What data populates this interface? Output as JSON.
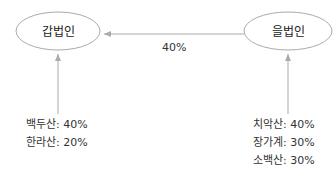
{
  "diagram": {
    "colors": {
      "stroke": "#aaaaaa",
      "text": "#333333",
      "background": "#ffffff"
    },
    "nodes": [
      {
        "id": "gap",
        "label": "갑법인"
      },
      {
        "id": "eul",
        "label": "을법인"
      }
    ],
    "edges": [
      {
        "from": "eul",
        "to": "gap",
        "label": "40%"
      }
    ],
    "shareholders": {
      "gap": [
        {
          "name": "백두산",
          "share": "40%",
          "text": "백두산: 40%"
        },
        {
          "name": "한라산",
          "share": "20%",
          "text": "한라산: 20%"
        }
      ],
      "eul": [
        {
          "name": "치악산",
          "share": "40%",
          "text": "치악산: 40%"
        },
        {
          "name": "장가계",
          "share": "30%",
          "text": "장가계: 30%"
        },
        {
          "name": "소백산",
          "share": "30%",
          "text": "소백산: 30%"
        }
      ]
    }
  }
}
